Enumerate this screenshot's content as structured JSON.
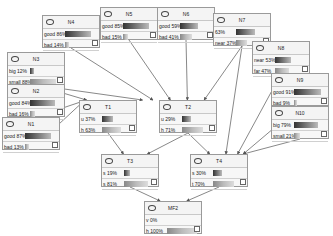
{
  "nodes": {
    "N4": {
      "title": "N4",
      "x": 42,
      "y": 15,
      "states": [
        {
          "label": "good",
          "pct": "86%",
          "v": 86
        },
        {
          "label": "bad",
          "pct": "14%",
          "v": 14
        }
      ]
    },
    "N5": {
      "title": "N5",
      "x": 100,
      "y": 7,
      "states": [
        {
          "label": "good",
          "pct": "85%",
          "v": 85
        },
        {
          "label": "bad",
          "pct": "15%",
          "v": 15
        }
      ]
    },
    "N6": {
      "title": "N6",
      "x": 157,
      "y": 7,
      "states": [
        {
          "label": "good",
          "pct": "59%",
          "v": 59
        },
        {
          "label": "bad",
          "pct": "41%",
          "v": 41
        }
      ]
    },
    "N7": {
      "title": "N7",
      "x": 213,
      "y": 13,
      "states": [
        {
          "label": "",
          "pct": "63%",
          "v": 63
        },
        {
          "label": "near",
          "pct": "37%",
          "v": 37
        }
      ]
    },
    "N3": {
      "title": "N3",
      "x": 7,
      "y": 52,
      "states": [
        {
          "label": "big",
          "pct": "12%",
          "v": 12
        },
        {
          "label": "small",
          "pct": "88%",
          "v": 88
        }
      ]
    },
    "N8": {
      "title": "N8",
      "x": 252,
      "y": 41,
      "states": [
        {
          "label": "near",
          "pct": "53%",
          "v": 53
        },
        {
          "label": "far",
          "pct": "47%",
          "v": 47
        }
      ]
    },
    "N2": {
      "title": "N2",
      "x": 7,
      "y": 84,
      "states": [
        {
          "label": "good",
          "pct": "84%",
          "v": 84
        },
        {
          "label": "bad",
          "pct": "16%",
          "v": 16
        }
      ]
    },
    "N9": {
      "title": "N9",
      "x": 271,
      "y": 73,
      "states": [
        {
          "label": "good",
          "pct": "91%",
          "v": 91
        },
        {
          "label": "bad",
          "pct": "9%",
          "v": 9
        }
      ]
    },
    "N1": {
      "title": "N1",
      "x": 2,
      "y": 117,
      "states": [
        {
          "label": "good",
          "pct": "87%",
          "v": 87
        },
        {
          "label": "bad",
          "pct": "13%",
          "v": 13
        }
      ]
    },
    "N10": {
      "title": "N10",
      "x": 271,
      "y": 106,
      "states": [
        {
          "label": "big",
          "pct": "79%",
          "v": 79
        },
        {
          "label": "small",
          "pct": "21%",
          "v": 21
        }
      ]
    },
    "T1": {
      "title": "T1",
      "x": 79,
      "y": 100,
      "states": [
        {
          "label": "u",
          "pct": "37%",
          "v": 37
        },
        {
          "label": "h",
          "pct": "63%",
          "v": 63
        }
      ]
    },
    "T2": {
      "title": "T2",
      "x": 159,
      "y": 100,
      "states": [
        {
          "label": "u",
          "pct": "29%",
          "v": 29
        },
        {
          "label": "h",
          "pct": "71%",
          "v": 71
        }
      ]
    },
    "T3": {
      "title": "T3",
      "x": 101,
      "y": 154,
      "states": [
        {
          "label": "s",
          "pct": "19%",
          "v": 19
        },
        {
          "label": "s",
          "pct": "81%",
          "v": 81
        }
      ]
    },
    "T4": {
      "title": "T4",
      "x": 190,
      "y": 154,
      "states": [
        {
          "label": "s",
          "pct": "30%",
          "v": 30
        },
        {
          "label": "t",
          "pct": "70%",
          "v": 70
        }
      ]
    },
    "MF2": {
      "title": "MF2",
      "x": 144,
      "y": 201,
      "states": [
        {
          "label": "v",
          "pct": "0%",
          "v": 0
        },
        {
          "label": "h",
          "pct": "100%",
          "v": 100
        }
      ]
    }
  },
  "edges": [
    [
      "N4",
      "T2"
    ],
    [
      "N5",
      "T2"
    ],
    [
      "N6",
      "T2"
    ],
    [
      "N7",
      "T2"
    ],
    [
      "N7",
      "T4"
    ],
    [
      "N3",
      "T1"
    ],
    [
      "N3",
      "T2"
    ],
    [
      "N2",
      "T1"
    ],
    [
      "N1",
      "T1"
    ],
    [
      "N8",
      "T4"
    ],
    [
      "N9",
      "T4"
    ],
    [
      "N10",
      "T4"
    ],
    [
      "T1",
      "T3"
    ],
    [
      "T2",
      "T3"
    ],
    [
      "T2",
      "T4"
    ],
    [
      "T3",
      "MF2"
    ],
    [
      "T4",
      "MF2"
    ]
  ],
  "colors": {
    "edge": "#555555",
    "border": "#9a9a9a"
  }
}
